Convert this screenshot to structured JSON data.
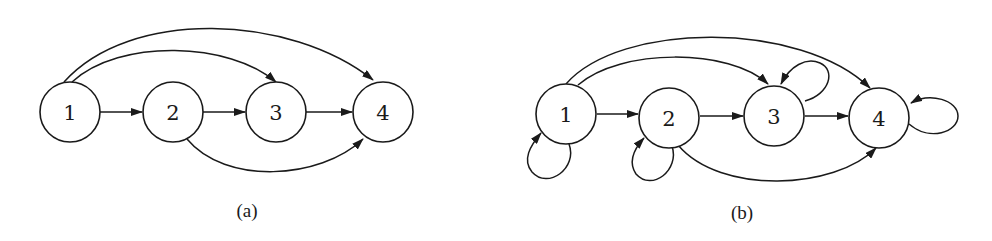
{
  "figure": {
    "panels": [
      {
        "id": "a",
        "caption": "(a)",
        "nodes": [
          {
            "id": 1,
            "label": "1"
          },
          {
            "id": 2,
            "label": "2"
          },
          {
            "id": 3,
            "label": "3"
          },
          {
            "id": 4,
            "label": "4"
          }
        ],
        "edges": [
          {
            "from": 1,
            "to": 2
          },
          {
            "from": 2,
            "to": 3
          },
          {
            "from": 3,
            "to": 4
          },
          {
            "from": 1,
            "to": 3
          },
          {
            "from": 1,
            "to": 4
          },
          {
            "from": 2,
            "to": 4
          }
        ]
      },
      {
        "id": "b",
        "caption": "(b)",
        "nodes": [
          {
            "id": 1,
            "label": "1"
          },
          {
            "id": 2,
            "label": "2"
          },
          {
            "id": 3,
            "label": "3"
          },
          {
            "id": 4,
            "label": "4"
          }
        ],
        "edges": [
          {
            "from": 1,
            "to": 2
          },
          {
            "from": 2,
            "to": 3
          },
          {
            "from": 3,
            "to": 4
          },
          {
            "from": 1,
            "to": 3
          },
          {
            "from": 1,
            "to": 4
          },
          {
            "from": 2,
            "to": 4
          },
          {
            "from": 1,
            "to": 1
          },
          {
            "from": 2,
            "to": 2
          },
          {
            "from": 3,
            "to": 3
          },
          {
            "from": 4,
            "to": 4
          }
        ]
      }
    ]
  }
}
